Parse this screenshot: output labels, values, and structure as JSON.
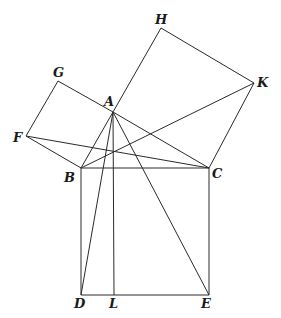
{
  "diagram": {
    "points": {
      "A": {
        "label": "A",
        "x": 113,
        "y": 112
      },
      "B": {
        "label": "B",
        "x": 81,
        "y": 168
      },
      "C": {
        "label": "C",
        "x": 209,
        "y": 168
      },
      "D": {
        "label": "D",
        "x": 81,
        "y": 295
      },
      "E": {
        "label": "E",
        "x": 209,
        "y": 295
      },
      "L": {
        "label": "L",
        "x": 114,
        "y": 295
      },
      "F": {
        "label": "F",
        "x": 26,
        "y": 136
      },
      "G": {
        "label": "G",
        "x": 58,
        "y": 81
      },
      "H": {
        "label": "H",
        "x": 161,
        "y": 28
      },
      "K": {
        "label": "K",
        "x": 254,
        "y": 83
      }
    },
    "segments": [
      [
        "B",
        "C"
      ],
      [
        "C",
        "E"
      ],
      [
        "E",
        "D"
      ],
      [
        "D",
        "B"
      ],
      [
        "A",
        "B"
      ],
      [
        "A",
        "C"
      ],
      [
        "F",
        "G"
      ],
      [
        "G",
        "A"
      ],
      [
        "F",
        "B"
      ],
      [
        "A",
        "H"
      ],
      [
        "H",
        "K"
      ],
      [
        "K",
        "C"
      ],
      [
        "A",
        "L"
      ],
      [
        "A",
        "D"
      ],
      [
        "A",
        "E"
      ],
      [
        "F",
        "C"
      ],
      [
        "B",
        "K"
      ]
    ]
  }
}
